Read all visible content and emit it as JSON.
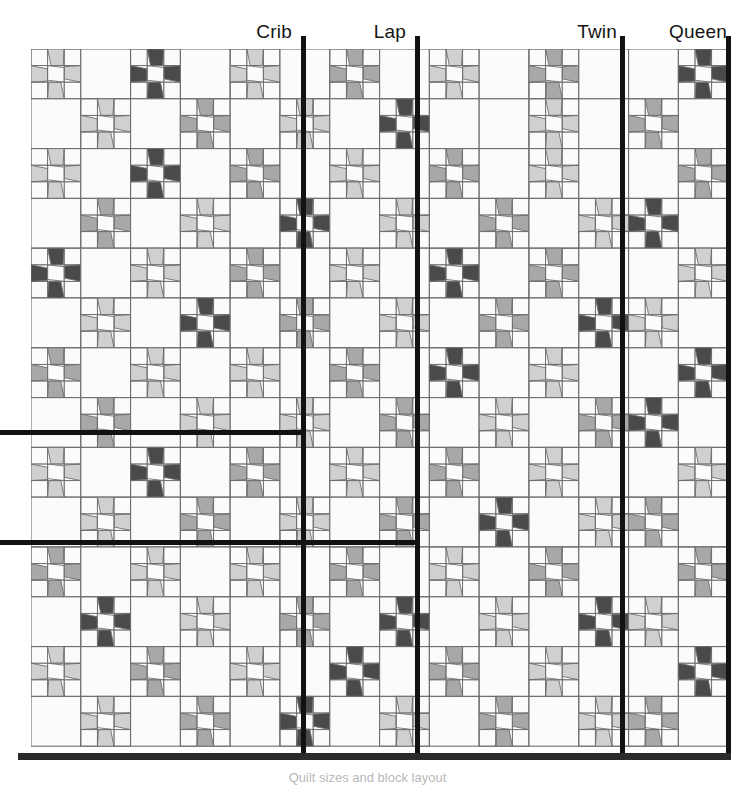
{
  "figure": {
    "caption": "Quilt sizes and block layout"
  },
  "size_labels": [
    {
      "name": "crib-size-label",
      "text": "Crib",
      "right_px": 443,
      "top_px": 22
    },
    {
      "name": "lap-size-label",
      "text": "Lap",
      "right_px": 329,
      "top_px": 22
    },
    {
      "name": "twin-size-label",
      "text": "Twin",
      "right_px": 118,
      "top_px": 22
    },
    {
      "name": "queen-size-label",
      "text": "Queen",
      "right_px": 8,
      "top_px": 22
    }
  ],
  "size_markers": {
    "vertical": [
      {
        "name": "crib-vertical-rule",
        "label": "Crib",
        "x": 301,
        "y": 36,
        "height": 723
      },
      {
        "name": "lap-vertical-rule",
        "label": "Lap",
        "x": 415,
        "y": 36,
        "height": 723
      },
      {
        "name": "twin-vertical-rule",
        "label": "Twin",
        "x": 620,
        "y": 36,
        "height": 723
      },
      {
        "name": "queen-vertical-rule",
        "label": "Queen",
        "x": 726,
        "y": 36,
        "height": 723
      }
    ],
    "horizontal": [
      {
        "name": "crib-horizontal-rule",
        "label": "Crib",
        "x": 0,
        "y": 430,
        "width": 306
      },
      {
        "name": "lap-horizontal-rule",
        "label": "Lap",
        "x": 0,
        "y": 540,
        "width": 420
      }
    ],
    "baseline": {
      "name": "quilt-baseline-rule",
      "x": 18,
      "y": 753,
      "width": 713
    }
  },
  "palette": {
    "background": "#ffffff",
    "patch_light": "#d0d0d0",
    "patch_medium": "#a8a8a8",
    "patch_dark": "#4a4a4a",
    "patch_white": "#fbfbfb",
    "outline": "#6e6e6e",
    "rule": "#121212",
    "baseline": "#2b2b2b"
  },
  "quilt": {
    "origin_x": 31,
    "origin_y": 49,
    "block_size": 49.8,
    "cols": 14,
    "rows": 14,
    "block_types": {
      "plain": "solid white block",
      "star": "pieced friendship-star block"
    },
    "shades": [
      "light",
      "medium",
      "dark"
    ],
    "grid": [
      [
        "L",
        "P",
        "D",
        "P",
        "L",
        "P",
        "M",
        "P",
        "L",
        "P",
        "M",
        "P",
        "P",
        "D"
      ],
      [
        "P",
        "L",
        "P",
        "M",
        "P",
        "L",
        "P",
        "D",
        "P",
        "P",
        "L",
        "P",
        "M",
        "P"
      ],
      [
        "L",
        "P",
        "D",
        "P",
        "M",
        "P",
        "L",
        "P",
        "M",
        "P",
        "L",
        "P",
        "P",
        "M"
      ],
      [
        "P",
        "M",
        "P",
        "L",
        "P",
        "D",
        "P",
        "L",
        "P",
        "M",
        "P",
        "L",
        "D",
        "P"
      ],
      [
        "D",
        "P",
        "L",
        "P",
        "M",
        "P",
        "L",
        "P",
        "D",
        "P",
        "M",
        "P",
        "P",
        "L"
      ],
      [
        "P",
        "L",
        "P",
        "D",
        "P",
        "M",
        "P",
        "L",
        "P",
        "M",
        "P",
        "D",
        "L",
        "P"
      ],
      [
        "M",
        "P",
        "L",
        "P",
        "L",
        "P",
        "M",
        "P",
        "D",
        "P",
        "L",
        "P",
        "P",
        "D"
      ],
      [
        "P",
        "M",
        "P",
        "L",
        "P",
        "L",
        "P",
        "M",
        "P",
        "L",
        "P",
        "M",
        "D",
        "P"
      ],
      [
        "L",
        "P",
        "D",
        "P",
        "M",
        "P",
        "L",
        "P",
        "M",
        "P",
        "L",
        "P",
        "P",
        "L"
      ],
      [
        "P",
        "L",
        "P",
        "M",
        "P",
        "L",
        "P",
        "M",
        "P",
        "D",
        "P",
        "L",
        "M",
        "P"
      ],
      [
        "M",
        "P",
        "L",
        "P",
        "L",
        "P",
        "M",
        "P",
        "L",
        "P",
        "M",
        "P",
        "P",
        "M"
      ],
      [
        "P",
        "D",
        "P",
        "L",
        "P",
        "M",
        "P",
        "D",
        "P",
        "L",
        "P",
        "D",
        "L",
        "P"
      ],
      [
        "L",
        "P",
        "M",
        "P",
        "L",
        "P",
        "D",
        "P",
        "M",
        "P",
        "L",
        "P",
        "P",
        "D"
      ],
      [
        "P",
        "L",
        "P",
        "M",
        "P",
        "D",
        "P",
        "L",
        "P",
        "M",
        "P",
        "L",
        "M",
        "P"
      ]
    ]
  }
}
